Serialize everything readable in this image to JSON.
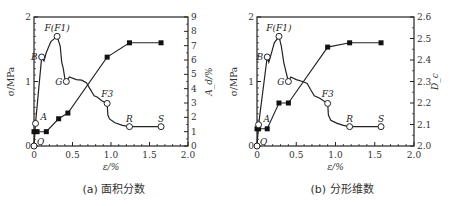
{
  "chart_data": [
    {
      "type": "line",
      "caption": "(a) 面积分数",
      "xlabel": "ε/%",
      "ylabel": "σ/MPa",
      "y2label": "A_d/%",
      "xlim": [
        0,
        2.0
      ],
      "ylim": [
        0,
        2
      ],
      "y2lim": [
        0,
        9
      ],
      "xticks": [
        "0",
        "0.5",
        "1.0",
        "1.5",
        "2.0"
      ],
      "yticks": [
        "0",
        "1",
        "2"
      ],
      "y2ticks": [
        "0",
        "1",
        "2",
        "3",
        "4",
        "5",
        "6",
        "7",
        "8",
        "9"
      ],
      "series": [
        {
          "name": "stress-strain",
          "axis": "left",
          "marker": "open-circle",
          "curve": [
            [
              0,
              0
            ],
            [
              0.02,
              0.35
            ],
            [
              0.1,
              1.38
            ],
            [
              0.13,
              1.32
            ],
            [
              0.16,
              1.45
            ],
            [
              0.22,
              1.62
            ],
            [
              0.3,
              1.7
            ],
            [
              0.34,
              1.55
            ],
            [
              0.36,
              1.3
            ],
            [
              0.38,
              1.2
            ],
            [
              0.4,
              1.05
            ],
            [
              0.42,
              1.0
            ],
            [
              0.46,
              1.07
            ],
            [
              0.55,
              1.03
            ],
            [
              0.62,
              1.02
            ],
            [
              0.68,
              0.98
            ],
            [
              0.72,
              0.9
            ],
            [
              0.78,
              0.78
            ],
            [
              0.82,
              0.76
            ],
            [
              0.88,
              0.7
            ],
            [
              0.95,
              0.66
            ],
            [
              0.96,
              0.48
            ],
            [
              0.98,
              0.42
            ],
            [
              1.05,
              0.36
            ],
            [
              1.15,
              0.32
            ],
            [
              1.24,
              0.3
            ],
            [
              1.65,
              0.3
            ]
          ],
          "points": [
            {
              "label": "O",
              "x": 0,
              "y": 0
            },
            {
              "label": "A",
              "x": 0.02,
              "y": 0.35
            },
            {
              "label": "B",
              "x": 0.1,
              "y": 1.38
            },
            {
              "label": "F(F1)",
              "x": 0.3,
              "y": 1.7
            },
            {
              "label": "G",
              "x": 0.42,
              "y": 1.0
            },
            {
              "label": "F3",
              "x": 0.95,
              "y": 0.66
            },
            {
              "label": "R",
              "x": 1.24,
              "y": 0.3
            },
            {
              "label": "S",
              "x": 1.65,
              "y": 0.3
            }
          ]
        },
        {
          "name": "A_d",
          "axis": "right",
          "marker": "filled-square",
          "points": [
            [
              0,
              1.0
            ],
            [
              0.04,
              1.0
            ],
            [
              0.16,
              1.0
            ],
            [
              0.32,
              1.9
            ],
            [
              0.44,
              2.3
            ],
            [
              0.95,
              6.2
            ],
            [
              1.24,
              7.2
            ],
            [
              1.65,
              7.2
            ]
          ]
        }
      ]
    },
    {
      "type": "line",
      "caption": "(b) 分形维数",
      "xlabel": "ε/%",
      "ylabel": "σ/MPa",
      "y2label": "D_c",
      "xlim": [
        0,
        2.0
      ],
      "ylim": [
        0,
        2
      ],
      "y2lim": [
        2.0,
        2.6
      ],
      "xticks": [
        "0",
        "0.5",
        "1.0",
        "1.5",
        "2.0"
      ],
      "yticks": [
        "0",
        "1",
        "2"
      ],
      "y2ticks": [
        "2.0",
        "2.1",
        "2.2",
        "2.3",
        "2.4",
        "2.5",
        "2.6"
      ],
      "series": [
        {
          "name": "stress-strain",
          "axis": "left",
          "marker": "open-circle",
          "curve": [
            [
              0,
              0
            ],
            [
              0.02,
              0.33
            ],
            [
              0.13,
              1.38
            ],
            [
              0.15,
              1.3
            ],
            [
              0.18,
              1.42
            ],
            [
              0.22,
              1.6
            ],
            [
              0.28,
              1.7
            ],
            [
              0.31,
              1.55
            ],
            [
              0.34,
              1.3
            ],
            [
              0.37,
              1.15
            ],
            [
              0.4,
              1.0
            ],
            [
              0.43,
              1.07
            ],
            [
              0.5,
              1.03
            ],
            [
              0.58,
              1.0
            ],
            [
              0.64,
              0.97
            ],
            [
              0.68,
              0.88
            ],
            [
              0.73,
              0.78
            ],
            [
              0.8,
              0.74
            ],
            [
              0.86,
              0.69
            ],
            [
              0.9,
              0.66
            ],
            [
              0.91,
              0.48
            ],
            [
              0.94,
              0.4
            ],
            [
              1.02,
              0.35
            ],
            [
              1.1,
              0.32
            ],
            [
              1.18,
              0.3
            ],
            [
              1.58,
              0.3
            ]
          ],
          "points": [
            {
              "label": "O",
              "x": 0,
              "y": 0
            },
            {
              "label": "A",
              "x": 0.02,
              "y": 0.33
            },
            {
              "label": "B",
              "x": 0.13,
              "y": 1.38
            },
            {
              "label": "F(F1)",
              "x": 0.28,
              "y": 1.7
            },
            {
              "label": "G",
              "x": 0.4,
              "y": 1.0
            },
            {
              "label": "F3",
              "x": 0.9,
              "y": 0.66
            },
            {
              "label": "R",
              "x": 1.18,
              "y": 0.3
            },
            {
              "label": "S",
              "x": 1.58,
              "y": 0.3
            }
          ]
        },
        {
          "name": "D_c",
          "axis": "right",
          "marker": "filled-square",
          "points": [
            [
              0,
              2.08
            ],
            [
              0.02,
              2.08
            ],
            [
              0.13,
              2.08
            ],
            [
              0.28,
              2.2
            ],
            [
              0.4,
              2.2
            ],
            [
              0.9,
              2.46
            ],
            [
              1.18,
              2.48
            ],
            [
              1.58,
              2.48
            ]
          ]
        }
      ]
    }
  ]
}
